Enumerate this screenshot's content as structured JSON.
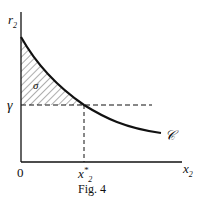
{
  "figure": {
    "caption": "Fig. 4",
    "y_axis_label": "r",
    "y_axis_sub": "2",
    "x_axis_label": "x",
    "x_axis_sub": "2",
    "origin_label": "0",
    "gamma_label": "γ",
    "x_star_label": "x",
    "x_star_sub": "2",
    "x_star_sup": "*",
    "region_label": "σ",
    "curve_label": "𝒞",
    "colors": {
      "line": "#111111",
      "background": "#ffffff"
    }
  }
}
